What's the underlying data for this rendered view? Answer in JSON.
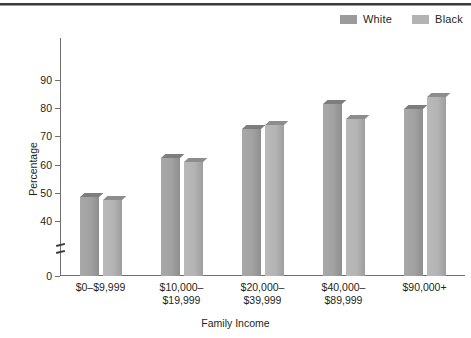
{
  "chart_data": {
    "type": "bar",
    "title": "",
    "xlabel": "Family Income",
    "ylabel": "Percentage",
    "categories": [
      "$0–$9,999",
      "$10,000–\n$19,999",
      "$20,000–\n$39,999",
      "$40,000–\n$89,999",
      "$90,000+"
    ],
    "category_lines": [
      [
        "$0–$9,999"
      ],
      [
        "$10,000–",
        "$19,999"
      ],
      [
        "$20,000–",
        "$39,999"
      ],
      [
        "$40,000–",
        "$89,999"
      ],
      [
        "$90,000+"
      ]
    ],
    "series": [
      {
        "name": "White",
        "color": "#a2a2a2",
        "values": [
          48.5,
          62.5,
          72.8,
          81.5,
          79.7
        ]
      },
      {
        "name": "Black",
        "color": "#b4b4b4",
        "values": [
          47.3,
          61.0,
          74.0,
          76.0,
          84.0
        ]
      }
    ],
    "ylim": [
      0,
      95
    ],
    "ytick_labels": [
      "0",
      "40",
      "50",
      "60",
      "70",
      "80",
      "90"
    ],
    "ytick_values": [
      0,
      40,
      50,
      60,
      70,
      80,
      90
    ],
    "y_axis_break": true,
    "y_axis_break_between": [
      0,
      40
    ],
    "grid": false,
    "legend_position": "top-right",
    "legend_entries": [
      "White",
      "Black"
    ]
  },
  "legend": {
    "items": [
      {
        "label": "White",
        "swatch": "white-swatch"
      },
      {
        "label": "Black",
        "swatch": "black-swatch"
      }
    ]
  },
  "axes": {
    "y_title": "Percentage",
    "x_title": "Family Income"
  }
}
